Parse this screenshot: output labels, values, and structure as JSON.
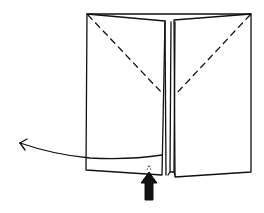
{
  "diagram": {
    "type": "origami-fold-step",
    "background": "#ffffff",
    "stroke_color": "#111111",
    "elements": {
      "left_panel": {
        "label": ""
      },
      "right_panel": {
        "label": ""
      },
      "left_crease": {
        "style": "dashed"
      },
      "right_crease": {
        "style": "dashed"
      },
      "pull_arrow": {
        "direction": "left"
      },
      "push_arrow": {
        "direction": "up"
      }
    }
  }
}
